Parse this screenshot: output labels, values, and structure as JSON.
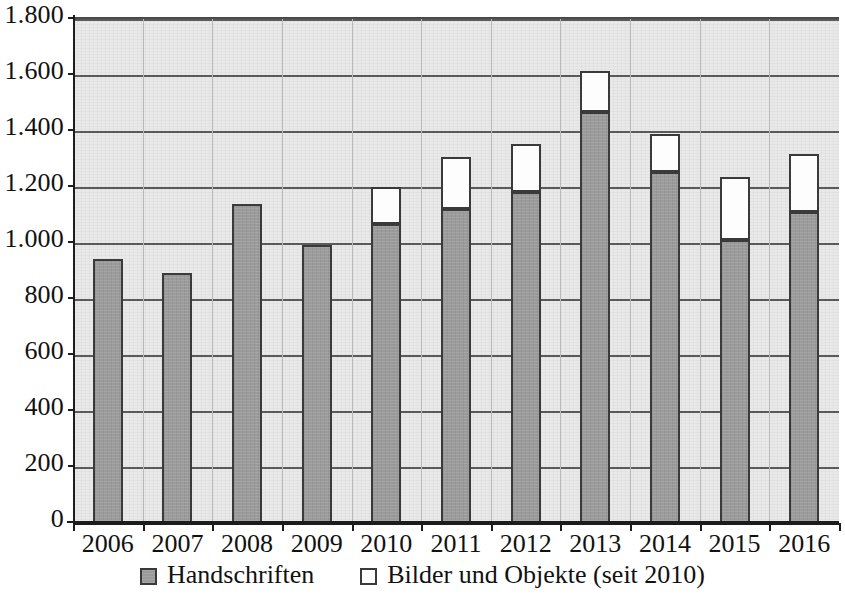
{
  "chart_data": {
    "type": "bar",
    "stacked": true,
    "title": "",
    "subtitle": "",
    "xlabel": "",
    "ylabel": "",
    "categories": [
      "2006",
      "2007",
      "2008",
      "2009",
      "2010",
      "2011",
      "2012",
      "2013",
      "2014",
      "2015",
      "2016"
    ],
    "series": [
      {
        "name": "Handschriften",
        "color": "#9b9b9b",
        "values": [
          944,
          893,
          1139,
          993,
          1068,
          1121,
          1182,
          1468,
          1254,
          1011,
          1111
        ]
      },
      {
        "name": "Bilder und Objekte (seit 2010)",
        "color": "#ffffff",
        "values": [
          0,
          0,
          0,
          0,
          125,
          179,
          164,
          139,
          128,
          218,
          200
        ]
      }
    ],
    "totals": [
      944,
      893,
      1139,
      993,
      1193,
      1300,
      1346,
      1607,
      1382,
      1229,
      1311
    ],
    "ylim": [
      0,
      1800
    ],
    "ytick_values": [
      0,
      200,
      400,
      600,
      800,
      1000,
      1200,
      1400,
      1600,
      1800
    ],
    "ytick_labels": [
      "0",
      "200",
      "400",
      "600",
      "800",
      "1.000",
      "1.200",
      "1.400",
      "1.600",
      "1.800"
    ],
    "grid": true,
    "grid_axis": "y",
    "legend_position": "bottom",
    "plot_background": "#e9e9e9"
  },
  "legend": {
    "items": [
      {
        "label": "Handschriften",
        "swatch": "filled-gray-square-icon"
      },
      {
        "label": "Bilder und Objekte (seit 2010)",
        "swatch": "empty-white-square-icon"
      }
    ]
  }
}
